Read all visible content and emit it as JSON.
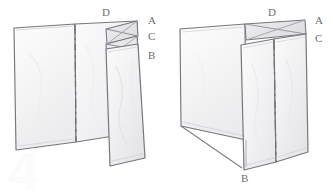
{
  "figure": {
    "medium": "pencil-sketch",
    "background_color": "#ffffff",
    "stroke_color": "#6b6b70",
    "fill_color": "#f6f6f7",
    "label_color": "#6e6e72",
    "watermark": {
      "text": "4",
      "color": "#fbfbfb"
    },
    "panels": [
      {
        "id": "left-figure",
        "name": "partially-folded-view",
        "description": "Large flat panel with vertical crease and narrow folded flap at right",
        "labels": [
          {
            "text": "D",
            "x": 102,
            "y": 8
          },
          {
            "text": "A",
            "x": 148,
            "y": 17
          },
          {
            "text": "C",
            "x": 148,
            "y": 31
          },
          {
            "text": "B",
            "x": 148,
            "y": 50
          }
        ]
      },
      {
        "id": "right-figure",
        "name": "folded-view",
        "description": "Panel folded into an open box shape with two faces meeting at a vertical edge",
        "labels": [
          {
            "text": "D",
            "x": 268,
            "y": 8
          },
          {
            "text": "A",
            "x": 315,
            "y": 17
          },
          {
            "text": "C",
            "x": 315,
            "y": 33
          },
          {
            "text": "B",
            "x": 241,
            "y": 174
          }
        ]
      }
    ]
  }
}
